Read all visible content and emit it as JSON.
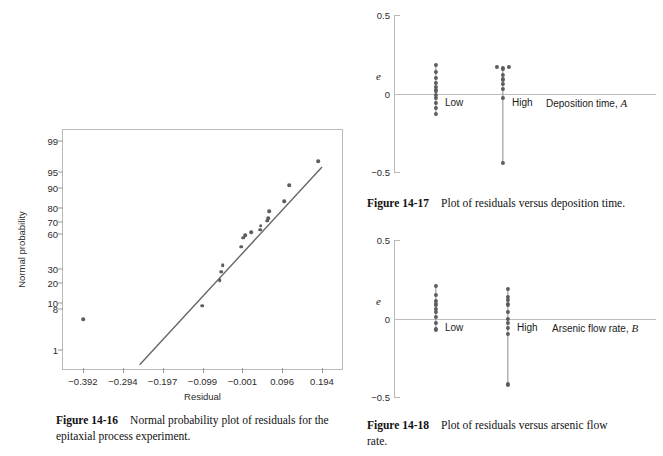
{
  "figures": {
    "fig_14_16": {
      "caption_label": "Figure 14-16",
      "caption_text_line1": "Normal probability plot of residuals for the",
      "caption_text_line2": "epitaxial process experiment.",
      "xlabel": "Residual",
      "ylabel": "Normal probability"
    },
    "fig_14_17": {
      "caption_label": "Figure 14-17",
      "caption_text_line1": "Plot of residuals versus deposition time.",
      "caption_text_line2": "",
      "ylabel": "e",
      "factor_label_text": "Deposition time, ",
      "factor_label_symbol": "A",
      "group_low": "Low",
      "group_high": "High",
      "ytick_top": "0.5",
      "ytick_mid": "0",
      "ytick_bottom": "-0.5"
    },
    "fig_14_18": {
      "caption_label": "Figure 14-18",
      "caption_text_line1": "Plot of residuals versus arsenic flow",
      "caption_text_line2": "rate.",
      "ylabel": "e",
      "factor_label_text": "Arsenic flow rate, ",
      "factor_label_symbol": "B",
      "group_low": "Low",
      "group_high": "High",
      "ytick_top": "0.5",
      "ytick_mid": "0",
      "ytick_bottom": "-0.5"
    }
  },
  "colors": {
    "marker": "#5d5d5d",
    "line": "#666666",
    "axis": "#b9b9b9",
    "zero_line": "#bdbdbd",
    "text": "#1a1a1a"
  },
  "chart_data": [
    {
      "id": "fig_14_16",
      "type": "scatter",
      "title": "Normal probability plot of residuals for the epitaxial process experiment.",
      "xlabel": "Residual",
      "ylabel": "Normal probability",
      "grid": false,
      "legend": "none",
      "xtick_labels": [
        "-0.392",
        "-0.294",
        "-0.197",
        "-0.099",
        "-0.001",
        "0.096",
        "0.194"
      ],
      "xtick_values": [
        -0.392,
        -0.294,
        -0.197,
        -0.099,
        -0.001,
        0.096,
        0.194
      ],
      "ytick_labels": [
        "99",
        "95",
        "90",
        "80",
        "70",
        "60",
        "30",
        "20",
        "10",
        "8",
        "1"
      ],
      "ytick_values": [
        99,
        95,
        90,
        80,
        70,
        60,
        30,
        20,
        10,
        8,
        1
      ],
      "y_scale": "normal-probability",
      "xlim": [
        -0.441,
        0.243
      ],
      "points": [
        {
          "x": -0.392,
          "y": 5
        },
        {
          "x": -0.1,
          "y": 9
        },
        {
          "x": -0.057,
          "y": 22
        },
        {
          "x": -0.053,
          "y": 28
        },
        {
          "x": -0.049,
          "y": 33
        },
        {
          "x": -0.004,
          "y": 49
        },
        {
          "x": 0.001,
          "y": 57
        },
        {
          "x": 0.006,
          "y": 59
        },
        {
          "x": 0.021,
          "y": 62
        },
        {
          "x": 0.042,
          "y": 64
        },
        {
          "x": 0.044,
          "y": 67
        },
        {
          "x": 0.06,
          "y": 71
        },
        {
          "x": 0.062,
          "y": 73
        },
        {
          "x": 0.065,
          "y": 78
        },
        {
          "x": 0.102,
          "y": 84
        },
        {
          "x": 0.113,
          "y": 91
        },
        {
          "x": 0.185,
          "y": 97
        }
      ],
      "fit_line": {
        "x1": -0.253,
        "y1": 0.4,
        "x2": 0.194,
        "y2": 96
      }
    },
    {
      "id": "fig_14_17",
      "type": "scatter",
      "title": "Plot of residuals versus deposition time.",
      "xlabel": "Deposition time, A",
      "ylabel": "e",
      "ylim": [
        -0.5,
        0.5
      ],
      "ytick_values": [
        0.5,
        0,
        -0.5
      ],
      "ytick_labels": [
        "0.5",
        "0",
        "-0.5"
      ],
      "categories": [
        "Low",
        "High"
      ],
      "series": [
        {
          "name": "Low",
          "values": [
            0.18,
            0.14,
            0.1,
            0.07,
            0.04,
            0.02,
            -0.01,
            -0.03,
            -0.06,
            -0.09,
            -0.13
          ]
        },
        {
          "name": "High",
          "values": [
            0.17,
            0.16,
            0.17,
            0.12,
            0.09,
            0.06,
            0.03,
            -0.03,
            -0.44
          ]
        }
      ],
      "high_jitter": [
        -0.02,
        0.0,
        0.02,
        0,
        0,
        0,
        0,
        0,
        0
      ]
    },
    {
      "id": "fig_14_18",
      "type": "scatter",
      "title": "Plot of residuals versus arsenic flow rate.",
      "xlabel": "Arsenic flow rate, B",
      "ylabel": "e",
      "ylim": [
        -0.5,
        0.5
      ],
      "ytick_values": [
        0.5,
        0,
        -0.5
      ],
      "ytick_labels": [
        "0.5",
        "0",
        "-0.5"
      ],
      "categories": [
        "Low",
        "High"
      ],
      "series": [
        {
          "name": "Low",
          "values": [
            0.21,
            0.15,
            0.11,
            0.09,
            0.06,
            0.04,
            0.01,
            -0.03,
            -0.07
          ]
        },
        {
          "name": "High",
          "values": [
            0.19,
            0.14,
            0.12,
            0.09,
            0.04,
            0.0,
            -0.03,
            -0.06,
            -0.1,
            -0.42
          ]
        }
      ]
    }
  ]
}
